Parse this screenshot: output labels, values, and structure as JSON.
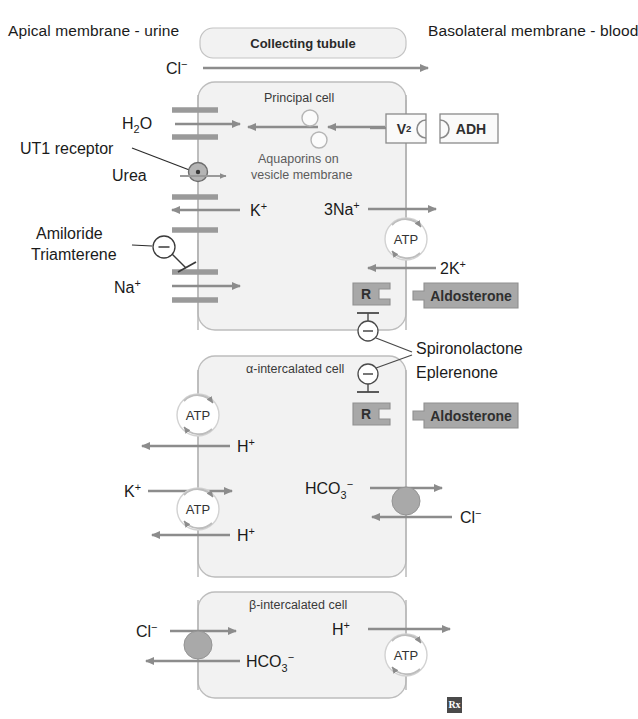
{
  "figure": {
    "title_left": "Apical membrane - urine",
    "title_right": "Basolateral membrane - blood",
    "tubule_label": "Collecting tubule",
    "rx_mark": "Rx"
  },
  "cells": [
    {
      "name": "Principal cell"
    },
    {
      "name": "α-intercalated cell"
    },
    {
      "name": "β-intercalated cell"
    }
  ],
  "notes": {
    "aquaporins": "Aquaporins on",
    "aquaporins2": "vesicle membrane"
  },
  "receptors": {
    "v2": "V",
    "v2_sub": "2",
    "adh": "ADH",
    "r1": "R",
    "r2": "R",
    "aldosterone1": "Aldosterone",
    "aldosterone2": "Aldosterone",
    "ut1": "UT1 receptor"
  },
  "pumps": {
    "atp_principal": "ATP",
    "atp_alpha_top": "ATP",
    "atp_alpha_bottom": "ATP",
    "atp_beta": "ATP"
  },
  "drugs": {
    "amiloride": "Amiloride",
    "triamterene": "Triamterene",
    "spironolactone": "Spironolactone",
    "eplerenone": "Eplerenone",
    "inhibit_symbol": "−"
  },
  "solutes": {
    "cl_tubule": {
      "base": "Cl",
      "sup": "−"
    },
    "h2o": {
      "base": "H",
      "sub": "2",
      "tail": "O"
    },
    "urea": {
      "base": "Urea"
    },
    "k_apical_principal": {
      "base": "K",
      "sup": "+"
    },
    "na_apical_principal": {
      "base": "Na",
      "sup": "+"
    },
    "na3_basal": {
      "pre": "3",
      "base": "Na",
      "sup": "+"
    },
    "k2_basal": {
      "pre": "2",
      "base": "K",
      "sup": "+"
    },
    "h_alpha_top": {
      "base": "H",
      "sup": "+"
    },
    "k_alpha": {
      "base": "K",
      "sup": "+"
    },
    "h_alpha_bottom": {
      "base": "H",
      "sup": "+"
    },
    "hco3_alpha": {
      "base": "HCO",
      "sub": "3",
      "sup": "−"
    },
    "cl_alpha": {
      "base": "Cl",
      "sup": "−"
    },
    "cl_beta": {
      "base": "Cl",
      "sup": "−"
    },
    "hco3_beta": {
      "base": "HCO",
      "sub": "3",
      "sup": "−"
    },
    "h_beta": {
      "base": "H",
      "sup": "+"
    }
  },
  "colors": {
    "cell_fill": "#f2f2f2",
    "cell_stroke": "#b9b9b9",
    "membrane": "#9a9a9a",
    "arrow": "#8c8c8c",
    "receptor_fill": "#a8a8a8",
    "receptor_stroke": "#8f8f8f",
    "transporter_fill": "#a9a9a9",
    "text": "#1b1b1b",
    "muted_text": "#5c5c5c",
    "rx_box": "#4a4a4a"
  }
}
